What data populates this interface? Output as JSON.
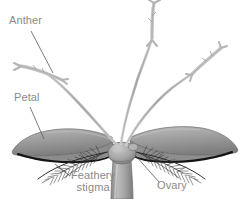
{
  "figure": {
    "kind": "botanical-diagram",
    "background_color": "#ffffff",
    "label_color": "#8a8a8a",
    "leader_line_color": "#555555",
    "petal_fill": "#9b9b9b",
    "petal_shadow": "#111111",
    "stem_fill": "#a8a8a8",
    "filament_color": "#bdbdbd",
    "stigma_color": "#2b2b2b"
  },
  "labels": {
    "anther": "Anther",
    "petal": "Petal",
    "feathery_stigma_line1": "Feathery",
    "feathery_stigma_line2": "stigma",
    "ovary": "Ovary"
  },
  "parts": [
    {
      "name": "anther",
      "label": "Anther",
      "count": 3
    },
    {
      "name": "petal",
      "label": "Petal",
      "count": 2
    },
    {
      "name": "feathery-stigma",
      "label": "Feathery stigma",
      "count": 2
    },
    {
      "name": "ovary",
      "label": "Ovary",
      "count": 1
    }
  ]
}
